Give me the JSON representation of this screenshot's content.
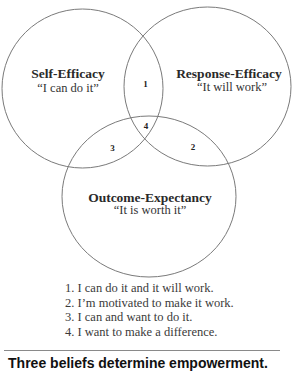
{
  "diagram": {
    "type": "venn",
    "circles": [
      {
        "id": "self_efficacy",
        "title": "Self-Efficacy",
        "quote": "“I can do it”"
      },
      {
        "id": "response_efficacy",
        "title": "Response-Efficacy",
        "quote": "“It will work”"
      },
      {
        "id": "outcome_expectancy",
        "title": "Outcome-Expectancy",
        "quote": "“It is worth it”"
      }
    ],
    "regions": [
      {
        "label": "1",
        "between": [
          "Self-Efficacy",
          "Response-Efficacy"
        ]
      },
      {
        "label": "2",
        "between": [
          "Response-Efficacy",
          "Outcome-Expectancy"
        ]
      },
      {
        "label": "3",
        "between": [
          "Self-Efficacy",
          "Outcome-Expectancy"
        ]
      },
      {
        "label": "4",
        "between": [
          "Self-Efficacy",
          "Response-Efficacy",
          "Outcome-Expectancy"
        ]
      }
    ],
    "legend": [
      "1. I can do it and it will work.",
      "2. I’m motivated to make it work.",
      "3. I can and want to do it.",
      "4. I want to make a difference."
    ],
    "caption": "Three beliefs determine empowerment.",
    "colors": {
      "stroke": "#7a7a7a",
      "text": "#2a2a2a",
      "background": "#ffffff"
    }
  }
}
